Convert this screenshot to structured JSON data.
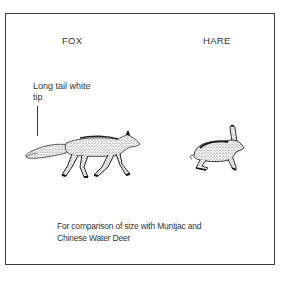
{
  "labels": {
    "fox": "FOX",
    "hare": "HARE"
  },
  "annotation": {
    "line1": "Long tail white",
    "line2": "tip"
  },
  "caption": {
    "line1": "For comparison of size with Muntjac and",
    "line2": "Chinese Water Deer"
  },
  "illustrations": {
    "fox": "fox-illustration",
    "hare": "hare-illustration"
  }
}
